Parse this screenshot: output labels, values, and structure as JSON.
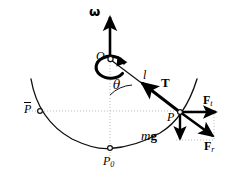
{
  "diagram": {
    "type": "physics-free-body-diagram",
    "canvas": {
      "width": 228,
      "height": 179
    },
    "colors": {
      "stroke": "#000000",
      "guide": "#b9b9b9",
      "background": "#ffffff",
      "marker_fill": "#ffffff"
    },
    "labels": {
      "omega": "ω",
      "pivot": "O",
      "theta": "θ",
      "length": "l",
      "tension": "T",
      "point_p": "P",
      "point_p_bar": "P",
      "point_p0_base": "P",
      "point_p0_sub": "0",
      "weight_m": "m",
      "weight_g": "g",
      "force_t_base": "F",
      "force_t_sub": "t",
      "force_r_base": "F",
      "force_r_sub": "r"
    },
    "geometry": {
      "pivot_point": {
        "x": 110,
        "y": 59
      },
      "mass_point": {
        "x": 180,
        "y": 112
      },
      "lowest_point": {
        "x": 110,
        "y": 148
      },
      "left_point": {
        "x": 40,
        "y": 111
      },
      "horizontal_guide_y": 111,
      "vertical_guide_x": 110,
      "omega_arrow_tip": {
        "x": 110,
        "y": 12
      },
      "angle_theta_degrees": 38
    },
    "vectors": [
      {
        "name": "omega",
        "label": "ω",
        "from": {
          "x": 110,
          "y": 59
        },
        "to": {
          "x": 110,
          "y": 12
        },
        "style": "bold"
      },
      {
        "name": "tension",
        "label": "T",
        "from": {
          "x": 180,
          "y": 112
        },
        "to": {
          "x": 140,
          "y": 81
        },
        "style": "bold"
      },
      {
        "name": "weight",
        "label": "mg",
        "from": {
          "x": 180,
          "y": 112
        },
        "to": {
          "x": 180,
          "y": 143
        },
        "style": "bold"
      },
      {
        "name": "force-tangential",
        "label": "Ft",
        "from": {
          "x": 180,
          "y": 112
        },
        "to": {
          "x": 220,
          "y": 112
        },
        "style": "bold"
      },
      {
        "name": "force-radial",
        "label": "Fr",
        "from": {
          "x": 180,
          "y": 112
        },
        "to": {
          "x": 216,
          "y": 139
        },
        "style": "bold"
      }
    ]
  }
}
